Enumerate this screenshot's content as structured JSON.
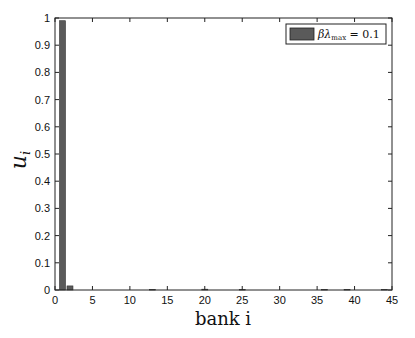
{
  "chart_data": {
    "type": "bar",
    "title": "",
    "xlabel": "bank i",
    "ylabel": "u_i",
    "xlim": [
      0,
      45
    ],
    "ylim": [
      0,
      1
    ],
    "xticks": [
      0,
      5,
      10,
      15,
      20,
      25,
      30,
      35,
      40,
      45
    ],
    "yticks": [
      0,
      0.1,
      0.2,
      0.3,
      0.4,
      0.5,
      0.6,
      0.7,
      0.8,
      0.9,
      1
    ],
    "grid": false,
    "legend_position": "upper right",
    "series": [
      {
        "name": "βλmax = 0.1",
        "color": "#5a5a5a",
        "x": [
          1,
          2,
          13,
          20,
          25,
          36,
          39,
          44
        ],
        "values": [
          0.99,
          0.015,
          0.002,
          0.003,
          0.002,
          0.002,
          0.002,
          0.002
        ]
      }
    ]
  },
  "labels": {
    "xlabel": "bank i",
    "ylabel_main": "u",
    "ylabel_sub": "i",
    "legend_beta": "βλ",
    "legend_sub": "max",
    "legend_value": " = 0.1"
  }
}
